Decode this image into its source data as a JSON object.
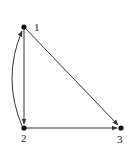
{
  "diagram": {
    "type": "directed-graph",
    "colors": {
      "edge": "#333333",
      "node": "#111111",
      "background": "#ffffff"
    },
    "nodes": [
      {
        "id": "1",
        "label": "1",
        "x": 24,
        "y": 27
      },
      {
        "id": "2",
        "label": "2",
        "x": 24,
        "y": 128
      },
      {
        "id": "3",
        "label": "3",
        "x": 121,
        "y": 128
      }
    ],
    "edges": [
      {
        "from": "1",
        "to": "2",
        "style": "straight"
      },
      {
        "from": "2",
        "to": "1",
        "style": "curved"
      },
      {
        "from": "1",
        "to": "3",
        "style": "straight"
      },
      {
        "from": "2",
        "to": "3",
        "style": "straight"
      }
    ]
  }
}
